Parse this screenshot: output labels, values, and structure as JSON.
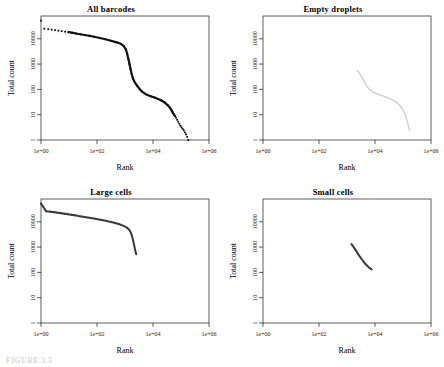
{
  "figure": {
    "caption_partial": "FIGURE 3.3",
    "xlabel": "Rank",
    "ylabel": "Total count"
  },
  "axes": {
    "x_ticks": [
      "1e+00",
      "1e+02",
      "1e+04",
      "1e+06"
    ],
    "x_tick_values": [
      0,
      2,
      4,
      6
    ],
    "y_ticks": [
      "10000",
      "1000",
      "100",
      "10",
      "1"
    ],
    "y_tick_values": [
      4,
      3,
      2,
      1,
      0
    ],
    "xlim": [
      0,
      6
    ],
    "ylim": [
      0,
      4.9
    ]
  },
  "colors": {
    "all_barcodes": "#111111",
    "empty_droplets": "#d0d0d0",
    "large_cells": "#3a3a3a",
    "small_cells": "#3a3a3a",
    "axis": "#1a1a1a"
  },
  "chart_data": [
    {
      "type": "scatter",
      "title": "All barcodes",
      "xlabel": "Rank",
      "ylabel": "Total count",
      "xlim": [
        0,
        6
      ],
      "ylim": [
        0,
        4.9
      ],
      "xscale": "log10",
      "yscale": "log10",
      "grid": false,
      "legend": "none",
      "x_log10": [
        0.0,
        0.12,
        0.26,
        0.38,
        0.5,
        0.62,
        0.74,
        0.86,
        0.98,
        1.1,
        1.25,
        1.4,
        1.55,
        1.72,
        1.9,
        2.1,
        2.3,
        2.5,
        2.7,
        2.85,
        2.95,
        3.03,
        3.08,
        3.12,
        3.16,
        3.2,
        3.24,
        3.28,
        3.32,
        3.36,
        3.4,
        3.45,
        3.52,
        3.6,
        3.7,
        3.8,
        3.92,
        4.05,
        4.18,
        4.3,
        4.42,
        4.52,
        4.6,
        4.66,
        4.7,
        4.74,
        4.78,
        4.82,
        4.86,
        4.9,
        4.94,
        4.98,
        5.02,
        5.06,
        5.1,
        5.14,
        5.18,
        5.22,
        5.26
      ],
      "y_log10": [
        4.72,
        4.4,
        4.38,
        4.36,
        4.34,
        4.32,
        4.3,
        4.28,
        4.26,
        4.24,
        4.21,
        4.18,
        4.15,
        4.12,
        4.08,
        4.03,
        3.98,
        3.92,
        3.86,
        3.8,
        3.72,
        3.58,
        3.4,
        3.2,
        3.0,
        2.8,
        2.6,
        2.45,
        2.34,
        2.26,
        2.2,
        2.12,
        2.02,
        1.92,
        1.84,
        1.78,
        1.73,
        1.68,
        1.62,
        1.56,
        1.48,
        1.38,
        1.28,
        1.18,
        1.1,
        1.02,
        0.95,
        0.88,
        0.8,
        0.72,
        0.64,
        0.56,
        0.5,
        0.44,
        0.38,
        0.3,
        0.22,
        0.12,
        0.0
      ]
    },
    {
      "type": "line",
      "title": "Empty droplets",
      "xlabel": "Rank",
      "ylabel": "Total count",
      "xlim": [
        0,
        6
      ],
      "ylim": [
        0,
        4.9
      ],
      "xscale": "log10",
      "yscale": "log10",
      "grid": false,
      "legend": "none",
      "x_log10": [
        3.36,
        3.42,
        3.48,
        3.55,
        3.62,
        3.7,
        3.78,
        3.86,
        3.95,
        4.05,
        4.18,
        4.32,
        4.48,
        4.62,
        4.75,
        4.86,
        4.95,
        5.02,
        5.08,
        5.13,
        5.17,
        5.2,
        5.22,
        5.24
      ],
      "y_log10": [
        2.75,
        2.68,
        2.58,
        2.45,
        2.3,
        2.14,
        2.02,
        1.94,
        1.88,
        1.83,
        1.78,
        1.72,
        1.66,
        1.58,
        1.5,
        1.4,
        1.28,
        1.14,
        0.98,
        0.82,
        0.66,
        0.52,
        0.42,
        0.36
      ]
    },
    {
      "type": "line",
      "title": "Large cells",
      "xlabel": "Rank",
      "ylabel": "Total count",
      "xlim": [
        0,
        6
      ],
      "ylim": [
        0,
        4.9
      ],
      "xscale": "log10",
      "yscale": "log10",
      "grid": false,
      "legend": "none",
      "x_log10": [
        0.0,
        0.18,
        0.34,
        0.48,
        0.6,
        0.72,
        0.84,
        0.96,
        1.08,
        1.2,
        1.34,
        1.5,
        1.66,
        1.84,
        2.02,
        2.22,
        2.42,
        2.62,
        2.8,
        2.95,
        3.05,
        3.12,
        3.18,
        3.22,
        3.26,
        3.3,
        3.33,
        3.36,
        3.38,
        3.4
      ],
      "y_log10": [
        4.72,
        4.42,
        4.4,
        4.38,
        4.36,
        4.34,
        4.32,
        4.3,
        4.28,
        4.26,
        4.23,
        4.2,
        4.17,
        4.14,
        4.1,
        4.06,
        4.01,
        3.96,
        3.9,
        3.84,
        3.78,
        3.72,
        3.64,
        3.54,
        3.4,
        3.22,
        3.05,
        2.9,
        2.8,
        2.72
      ]
    },
    {
      "type": "line",
      "title": "Small cells",
      "xlabel": "Rank",
      "ylabel": "Total count",
      "xlim": [
        0,
        6
      ],
      "ylim": [
        0,
        4.9
      ],
      "xscale": "log10",
      "yscale": "log10",
      "grid": false,
      "legend": "none",
      "x_log10": [
        3.16,
        3.2,
        3.26,
        3.33,
        3.41,
        3.5,
        3.58,
        3.66,
        3.73,
        3.79,
        3.84,
        3.88
      ],
      "y_log10": [
        3.12,
        3.06,
        2.96,
        2.84,
        2.7,
        2.56,
        2.44,
        2.33,
        2.25,
        2.19,
        2.15,
        2.12
      ]
    }
  ]
}
